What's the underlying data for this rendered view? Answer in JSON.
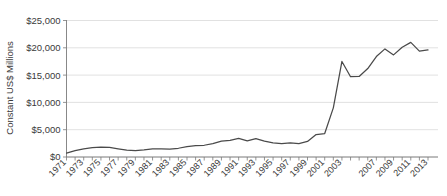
{
  "chart_data": {
    "type": "line",
    "title": "",
    "xlabel": "",
    "ylabel": "Constant US$ Millions",
    "ylim": [
      0,
      25000
    ],
    "xlim": [
      1971,
      2013
    ],
    "grid": true,
    "legend": "none",
    "y_tick_labels": [
      "$0",
      "$5,000",
      "$10,000",
      "$15,000",
      "$20,000",
      "$25,000"
    ],
    "y_tick_values": [
      0,
      5000,
      10000,
      15000,
      20000,
      25000
    ],
    "x_tick_labels": [
      "1971",
      "1973",
      "1975",
      "1977",
      "1979",
      "1981",
      "1983",
      "1985",
      "1987",
      "1989",
      "1991",
      "1993",
      "1995",
      "1997",
      "1999",
      "2001",
      "2003",
      "2007",
      "2009",
      "2011",
      "2013"
    ],
    "x": [
      1971,
      1972,
      1973,
      1974,
      1975,
      1976,
      1977,
      1978,
      1979,
      1980,
      1981,
      1982,
      1983,
      1984,
      1985,
      1986,
      1987,
      1988,
      1989,
      1990,
      1991,
      1992,
      1993,
      1994,
      1995,
      1996,
      1997,
      1998,
      1999,
      2000,
      2001,
      2002,
      2003,
      2004,
      2005,
      2006,
      2007,
      2008,
      2009,
      2010,
      2011,
      2012,
      2013
    ],
    "values": [
      700,
      1150,
      1500,
      1700,
      1800,
      1750,
      1500,
      1250,
      1150,
      1300,
      1500,
      1500,
      1450,
      1600,
      1900,
      2100,
      2150,
      2450,
      2900,
      3050,
      3400,
      2950,
      3350,
      2900,
      2600,
      2450,
      2600,
      2450,
      2850,
      4100,
      4300,
      9000,
      17500,
      14700,
      14750,
      16200,
      18400,
      19800,
      18700,
      20100,
      21000,
      19400,
      19600
    ],
    "series": [
      {
        "name": "Constant US$ Millions",
        "values": [
          700,
          1150,
          1500,
          1700,
          1800,
          1750,
          1500,
          1250,
          1150,
          1300,
          1500,
          1500,
          1450,
          1600,
          1900,
          2100,
          2150,
          2450,
          2900,
          3050,
          3400,
          2950,
          3350,
          2900,
          2600,
          2450,
          2600,
          2450,
          2850,
          4100,
          4300,
          9000,
          17500,
          14700,
          14750,
          16200,
          18400,
          19800,
          18700,
          20100,
          21000,
          19400,
          19600
        ]
      }
    ],
    "colors": {
      "line": "#4a4a4a",
      "grid": "#d9d9d9",
      "axis": "#7a7a7a",
      "text": "#3a3a3a",
      "background": "#ffffff"
    }
  }
}
